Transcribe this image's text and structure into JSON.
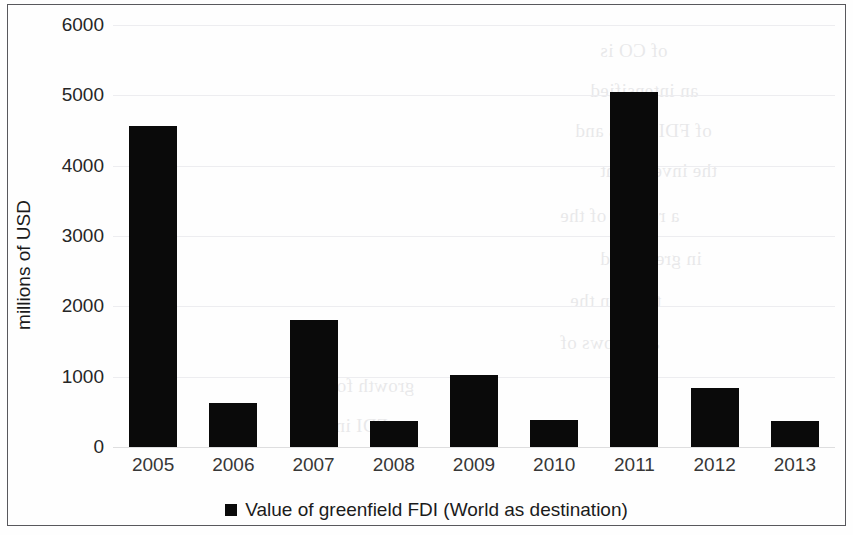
{
  "chart_data": {
    "type": "bar",
    "title": "",
    "subtitle": "",
    "xlabel": "",
    "ylabel": "millions of USD",
    "categories": [
      "2005",
      "2006",
      "2007",
      "2008",
      "2009",
      "2010",
      "2011",
      "2012",
      "2013"
    ],
    "values": [
      4560,
      625,
      1810,
      370,
      1025,
      385,
      5050,
      840,
      370
    ],
    "series": [
      {
        "name": "Value of greenfield FDI (World as destination)",
        "values": [
          4560,
          625,
          1810,
          370,
          1025,
          385,
          5050,
          840,
          370
        ],
        "color": "#0a0a0a"
      }
    ],
    "ylim": [
      0,
      6000
    ],
    "ytick_labels": [
      "0",
      "1000",
      "2000",
      "3000",
      "4000",
      "5000",
      "6000"
    ],
    "ytick_values": [
      0,
      1000,
      2000,
      3000,
      4000,
      5000,
      6000
    ],
    "grid": true,
    "grid_axis": "y",
    "legend": {
      "position": "bottom",
      "entries": [
        {
          "label": "Value of greenfield FDI (World as destination)",
          "marker": "square-marker",
          "color": "#0a0a0a"
        }
      ]
    },
    "colors": {
      "bar": "#0a0a0a",
      "grid": "#ededf0",
      "border": "#58585c",
      "text": "#1b1b1b",
      "background": "#fefefe"
    }
  },
  "bleed_text": [
    "of CO is",
    "an intensified",
    "of FDI flows and",
    "the investment",
    "a review of the",
    "in greenfield",
    "trend in the",
    "and flows of",
    "growth for the",
    "as FDI into the"
  ]
}
